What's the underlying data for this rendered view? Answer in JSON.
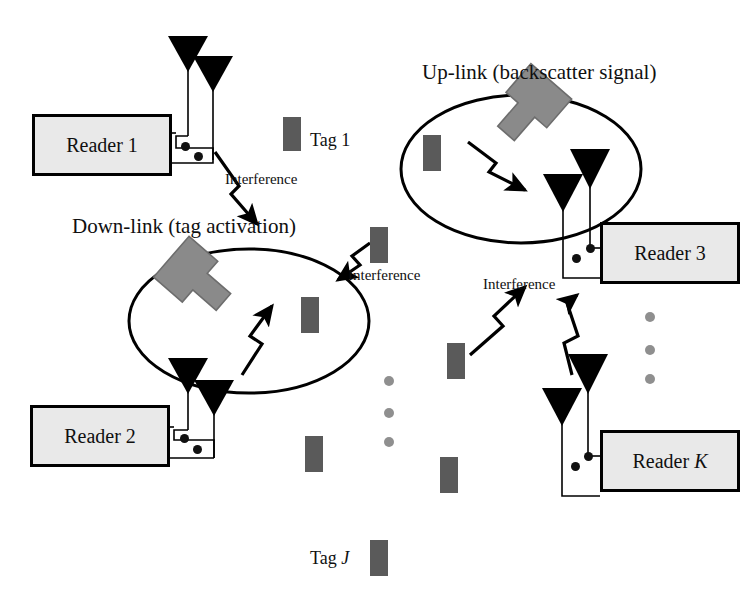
{
  "figure": {
    "kind": "rfid-reader-tag-network-diagram",
    "background_color": "#ffffff",
    "reader_fill": "#e9e9e9",
    "reader_border": "#000000",
    "tag_color": "#5a5a5a",
    "block_arrow_color": "#8a8a8a",
    "line_color": "#000000",
    "ellipsis_dot_color": "#8f8f8f"
  },
  "titles": {
    "uplink": "Up-link (backscatter signal)",
    "downlink": "Down-link (tag activation)"
  },
  "readers": [
    {
      "id": "reader-1",
      "label": "Reader 1",
      "x": 32,
      "y": 114,
      "w": 140,
      "h": 62
    },
    {
      "id": "reader-2",
      "label": "Reader 2",
      "x": 30,
      "y": 405,
      "w": 140,
      "h": 62
    },
    {
      "id": "reader-3",
      "label": "Reader 3",
      "x": 600,
      "y": 222,
      "w": 140,
      "h": 62
    },
    {
      "id": "reader-k",
      "label": "Reader K",
      "x": 600,
      "y": 430,
      "w": 140,
      "h": 62,
      "italic_tail": "K",
      "label_prefix": "Reader "
    }
  ],
  "tag_labels": [
    {
      "id": "tag-1",
      "text": "Tag 1",
      "x": 310,
      "y": 131
    },
    {
      "id": "tag-j",
      "text": "Tag J",
      "prefix": "Tag ",
      "italic_tail": "J",
      "x": 310,
      "y": 549
    }
  ],
  "interference_labels": [
    {
      "id": "interference-1",
      "text": "Interference",
      "x": 225,
      "y": 172
    },
    {
      "id": "interference-2",
      "text": "Interference",
      "x": 348,
      "y": 268
    },
    {
      "id": "interference-3",
      "text": "Interference",
      "x": 483,
      "y": 277
    }
  ],
  "tags": [
    {
      "id": "tag-rect-1",
      "x": 283,
      "y": 117,
      "w": 18,
      "h": 34
    },
    {
      "id": "tag-rect-uplink-inside",
      "x": 423,
      "y": 135,
      "w": 18,
      "h": 36
    },
    {
      "id": "tag-rect-mid-upper",
      "x": 370,
      "y": 227,
      "w": 18,
      "h": 36
    },
    {
      "id": "tag-rect-downlink-inside",
      "x": 301,
      "y": 297,
      "w": 18,
      "h": 36
    },
    {
      "id": "tag-rect-center",
      "x": 447,
      "y": 343,
      "w": 18,
      "h": 36
    },
    {
      "id": "tag-rect-lower-left",
      "x": 305,
      "y": 436,
      "w": 18,
      "h": 36
    },
    {
      "id": "tag-rect-lower-center",
      "x": 440,
      "y": 457,
      "w": 18,
      "h": 36
    },
    {
      "id": "tag-rect-tag-j",
      "x": 370,
      "y": 540,
      "w": 18,
      "h": 36
    }
  ],
  "ellipsis_columns": [
    {
      "id": "ellipsis-column-center",
      "dots": [
        {
          "x": 389,
          "y": 381
        },
        {
          "x": 389,
          "y": 413
        },
        {
          "x": 389,
          "y": 442
        }
      ],
      "r": 5
    },
    {
      "id": "ellipsis-column-right",
      "dots": [
        {
          "x": 650,
          "y": 317
        },
        {
          "x": 650,
          "y": 350
        },
        {
          "x": 650,
          "y": 379
        }
      ],
      "r": 5
    }
  ],
  "coverage_zones": [
    {
      "id": "uplink-coverage-ellipse",
      "cx": 521,
      "cy": 169,
      "rx": 120,
      "ry": 74
    },
    {
      "id": "downlink-coverage-ellipse",
      "cx": 249,
      "cy": 321,
      "rx": 120,
      "ry": 72
    }
  ],
  "block_arrows": [
    {
      "id": "uplink-block-arrow",
      "points_to": "uplink-coverage-ellipse"
    },
    {
      "id": "downlink-block-arrow",
      "points_to": "downlink-coverage-ellipse"
    }
  ],
  "antenna_groups": [
    {
      "id": "reader-1-antennas",
      "count": 2,
      "reader": "reader-1"
    },
    {
      "id": "reader-2-antennas",
      "count": 2,
      "reader": "reader-2"
    },
    {
      "id": "reader-3-antennas",
      "count": 2,
      "reader": "reader-3"
    },
    {
      "id": "reader-k-antennas",
      "count": 2,
      "reader": "reader-k"
    }
  ],
  "signal_arrows": [
    {
      "id": "downlink-signal-bolt",
      "kind": "lightning",
      "direction": "up-right",
      "inside": "downlink-coverage-ellipse"
    },
    {
      "id": "uplink-signal-bolt",
      "kind": "lightning",
      "direction": "down-right",
      "inside": "uplink-coverage-ellipse"
    },
    {
      "id": "interference-bolt-1",
      "kind": "lightning",
      "direction": "down",
      "from": "reader-1"
    },
    {
      "id": "interference-bolt-2",
      "kind": "lightning",
      "direction": "down-left",
      "to": "downlink-coverage-ellipse"
    },
    {
      "id": "interference-bolt-3",
      "kind": "lightning",
      "direction": "up-right",
      "to": "reader-3"
    },
    {
      "id": "interference-bolt-4",
      "kind": "lightning",
      "direction": "up",
      "to": "reader-3"
    }
  ]
}
